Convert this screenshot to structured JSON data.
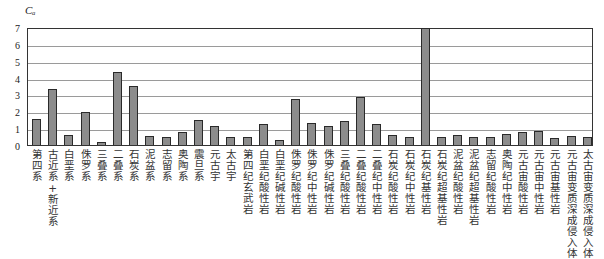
{
  "chart_data": {
    "type": "bar",
    "title": "",
    "xlabel": "",
    "ylabel": "Cₐ",
    "ylim": [
      0,
      7
    ],
    "yticks": [
      0,
      1,
      2,
      3,
      4,
      5,
      6,
      7
    ],
    "grid": true,
    "legend": null,
    "bar_color": "#8c8c8c",
    "categories": [
      "第四系",
      "古近系+新近系",
      "白垩系",
      "侏罗系",
      "三叠系",
      "二叠系",
      "石炭系",
      "泥盆系",
      "志留系",
      "奥陶系",
      "震旦系",
      "元古宇",
      "太古宇",
      "第四纪玄武岩",
      "白垩纪酸性岩",
      "白垩纪碱性岩",
      "侏罗纪酸性岩",
      "侏罗纪中性岩",
      "侏罗纪碱性岩",
      "三叠纪酸性岩",
      "二叠纪酸性岩",
      "二叠纪中性岩",
      "石炭纪酸性岩",
      "石炭纪中性岩",
      "石炭纪基性岩",
      "石炭纪超基性岩",
      "泥盆纪酸性岩",
      "泥盆纪超基性岩",
      "志留纪酸性岩",
      "奥陶纪中性岩",
      "元古宙酸性岩",
      "元古宙中性岩",
      "元古宙基性岩",
      "元古宙变质深成侵入体",
      "太古宙变质深成侵入体"
    ],
    "values": [
      1.55,
      3.35,
      0.6,
      1.95,
      0.2,
      4.35,
      3.5,
      0.55,
      0.45,
      0.8,
      1.5,
      1.1,
      0.5,
      0.45,
      1.25,
      0.3,
      2.75,
      1.3,
      1.15,
      1.4,
      2.85,
      1.25,
      0.6,
      0.5,
      6.95,
      0.5,
      0.58,
      0.48,
      0.48,
      0.65,
      0.78,
      0.85,
      0.4,
      0.53,
      0.48
    ]
  },
  "axis": {
    "unit_label": "Cₐ",
    "yticks": [
      "0",
      "1",
      "2",
      "3",
      "4",
      "5",
      "6",
      "7"
    ]
  }
}
